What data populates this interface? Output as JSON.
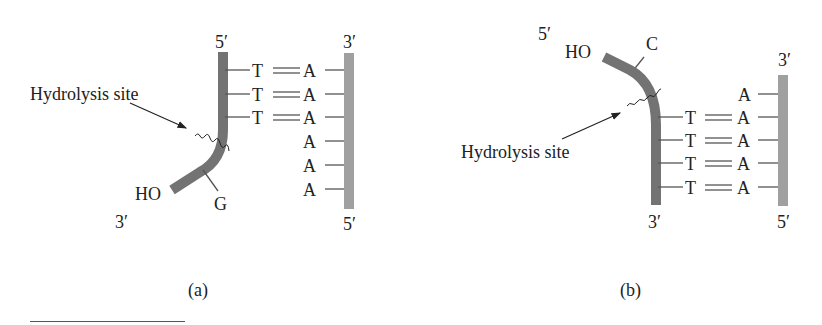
{
  "colors": {
    "strand_dark": "#737373",
    "strand_light": "#a0a0a0",
    "text": "#222222"
  },
  "panel_a": {
    "caption": "(a)",
    "hydrolysis_label": "Hydrolysis site",
    "left_strand": {
      "top_label": "5′",
      "bottom_label": "3′",
      "end_group": "HO",
      "side_base": "G"
    },
    "right_strand": {
      "top_label": "3′",
      "bottom_label": "5′"
    },
    "pairs": [
      {
        "left": "T",
        "bond": "═",
        "right": "A"
      },
      {
        "left": "T",
        "bond": "═",
        "right": "A"
      },
      {
        "left": "T",
        "bond": "═",
        "right": "A"
      },
      {
        "left": "",
        "bond": "",
        "right": "A"
      },
      {
        "left": "",
        "bond": "",
        "right": "A"
      },
      {
        "left": "",
        "bond": "",
        "right": "A"
      }
    ]
  },
  "panel_b": {
    "caption": "(b)",
    "hydrolysis_label": "Hydrolysis site",
    "left_strand": {
      "top_label": "5′",
      "bottom_label": "3′",
      "end_group": "HO",
      "side_base": "C"
    },
    "right_strand": {
      "top_label": "3′",
      "bottom_label": "5′"
    },
    "pairs": [
      {
        "left": "",
        "bond": "",
        "right": "A"
      },
      {
        "left": "T",
        "bond": "═",
        "right": "A"
      },
      {
        "left": "T",
        "bond": "═",
        "right": "A"
      },
      {
        "left": "T",
        "bond": "═",
        "right": "A"
      },
      {
        "left": "T",
        "bond": "═",
        "right": "A"
      }
    ]
  }
}
